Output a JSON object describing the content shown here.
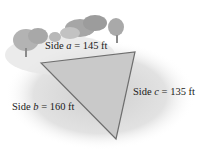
{
  "diagram": {
    "sides": [
      {
        "id": "a",
        "prefix": "Side ",
        "var": "a",
        "suffix": " = 145 ft",
        "length_ft": 145
      },
      {
        "id": "b",
        "prefix": "Side ",
        "var": "b",
        "suffix": " = 160 ft",
        "length_ft": 160
      },
      {
        "id": "c",
        "prefix": "Side ",
        "var": "c",
        "suffix": " = 135 ft",
        "length_ft": 135
      }
    ],
    "colors": {
      "triangle_fill": "#c9c9c9",
      "triangle_stroke": "#6e6e6e",
      "ground": "#dcdcdc",
      "trees": "#a9a9a9"
    }
  }
}
